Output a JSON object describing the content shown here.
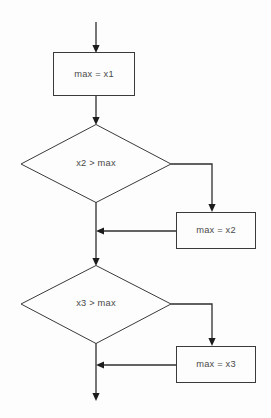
{
  "diagram": {
    "background_color": "#fdfdfd",
    "line_color": "#2e2e2e",
    "shape_stroke_color": "#3a3a3a",
    "text_color": "#4a4a4a",
    "nodes": [
      {
        "id": "assign-max-x1",
        "type": "process",
        "label": "max = x1",
        "x": 53,
        "y": 52,
        "width": 81,
        "height": 43
      },
      {
        "id": "decision-x2",
        "type": "decision",
        "label": "x2 > max",
        "cx": 96,
        "cy": 164,
        "rx": 75,
        "ry": 39
      },
      {
        "id": "assign-max-x2",
        "type": "process",
        "label": "max = x2",
        "x": 176,
        "y": 212,
        "width": 79,
        "height": 36
      },
      {
        "id": "decision-x3",
        "type": "decision",
        "label": "x3 > max",
        "cx": 96,
        "cy": 304,
        "rx": 75,
        "ry": 39
      },
      {
        "id": "assign-max-x3",
        "type": "process",
        "label": "max = x3",
        "x": 176,
        "y": 346,
        "width": 79,
        "height": 36
      }
    ],
    "edges": [
      {
        "id": "entry-to-assign-x1",
        "path": "M96,22 L96,48",
        "arrow": "down",
        "arrow_x": 96,
        "arrow_y": 52
      },
      {
        "id": "assign-x1-to-decision-x2",
        "path": "M96,95 L96,120",
        "arrow": "down",
        "arrow_x": 96,
        "arrow_y": 124
      },
      {
        "id": "decision-x2-true-branch",
        "path": "M171,164 L212,164 L212,208",
        "arrow": "down",
        "arrow_x": 212,
        "arrow_y": 212
      },
      {
        "id": "assign-x2-merge-back",
        "path": "M176,231 L100,231",
        "arrow": "left",
        "arrow_x": 96,
        "arrow_y": 231
      },
      {
        "id": "decision-x2-false-trunk",
        "path": "M96,202 L96,261",
        "arrow": "down",
        "arrow_x": 96,
        "arrow_y": 265
      },
      {
        "id": "decision-x3-true-branch",
        "path": "M171,304 L212,304 L212,342",
        "arrow": "down",
        "arrow_x": 212,
        "arrow_y": 346
      },
      {
        "id": "assign-x3-merge-back",
        "path": "M176,365 L100,365",
        "arrow": "left",
        "arrow_x": 96,
        "arrow_y": 365
      },
      {
        "id": "decision-x3-false-trunk",
        "path": "M96,343 L96,396",
        "arrow": "down",
        "arrow_x": 96,
        "arrow_y": 400
      }
    ]
  }
}
